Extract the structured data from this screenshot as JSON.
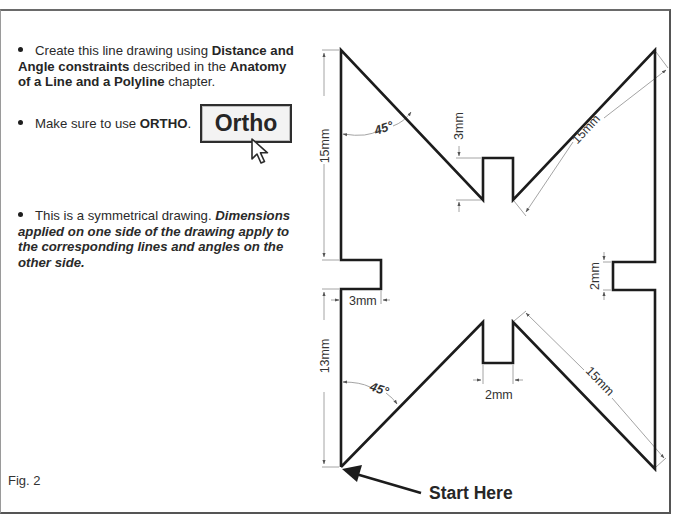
{
  "instructions": {
    "bullet1": {
      "t1": "Create this line drawing using ",
      "b1": "Distance and Angle constraints",
      "t2": " described in the ",
      "b2": "Anatomy of a Line and a Polyline",
      "t3": " chapter."
    },
    "bullet2": {
      "t1": "Make sure to use ",
      "b1": "ORTHO",
      "t2": "."
    },
    "ortho_button_label": "Ortho",
    "bullet3": {
      "t1": "This is a symmetrical drawing.  ",
      "em": "Dimensions applied on one side of the drawing apply to the corresponding lines and angles on the other side."
    }
  },
  "figure": {
    "label": "Fig. 2",
    "start_label": "Start Here",
    "dimensions": {
      "left_upper_vertical": "15mm",
      "upper_angle": "45°",
      "top_notch_depth": "3mm",
      "upper_right_diagonal": "15mm",
      "left_notch_depth": "3mm",
      "right_notch_width": "2mm",
      "left_lower_vertical": "13mm",
      "lower_angle": "45°",
      "bottom_notch_width": "2mm",
      "lower_right_diagonal": "15mm"
    },
    "colors": {
      "outline": "#1c1c1c",
      "dimension": "#9a9a9a",
      "text": "#2a2a2a"
    }
  }
}
